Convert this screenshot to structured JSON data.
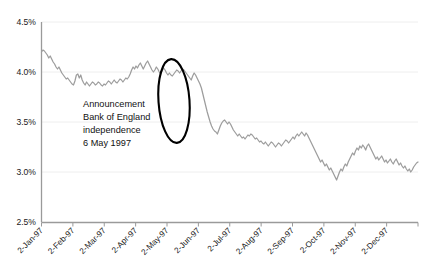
{
  "chart_data": {
    "type": "line",
    "title": "",
    "subtitle": "",
    "xlabel": "",
    "ylabel": "",
    "ylim": [
      2.5,
      4.5
    ],
    "ytick_values": [
      4.5,
      4.0,
      3.5,
      3.0,
      2.5
    ],
    "ytick_labels": [
      "4.5%",
      "4.0%",
      "3.5%",
      "3.0%",
      "2.5%"
    ],
    "grid": "horizontal",
    "legend": "none",
    "xtick_labels": [
      "2-Jan-97",
      "2-Feb-97",
      "2-Mar-97",
      "2-Apr-97",
      "2-May-97",
      "2-Jun-97",
      "2-Jul-97",
      "2-Aug-97",
      "2-Sep-97",
      "2-Oct-97",
      "2-Nov-97",
      "2-Dec-97"
    ],
    "series": [
      {
        "name": "rate",
        "color": "#9d9d9d",
        "x": [
          0,
          1,
          2,
          3,
          4,
          5,
          6,
          7,
          8,
          9,
          10,
          11,
          12,
          13,
          14,
          15,
          16,
          17,
          18,
          19,
          20,
          21,
          22,
          23,
          24,
          25,
          26,
          27,
          28,
          29,
          30,
          31,
          32,
          33,
          34,
          35,
          36,
          37,
          38,
          39,
          40,
          41,
          42,
          43,
          44,
          45,
          46,
          47,
          48,
          49,
          50,
          51,
          52,
          53,
          54,
          55,
          56,
          57,
          58,
          59,
          60,
          61,
          62,
          63,
          64,
          65,
          66,
          67,
          68,
          69,
          70,
          71,
          72,
          73,
          74,
          75,
          76,
          77,
          78,
          79,
          80,
          81,
          82,
          83,
          84,
          85,
          86,
          87,
          88,
          89,
          90,
          91,
          92,
          93,
          94,
          95,
          96,
          97,
          98,
          99,
          100,
          101,
          102,
          103,
          104,
          105,
          106,
          107,
          108,
          109,
          110,
          111,
          112,
          113,
          114,
          115,
          116,
          117,
          118,
          119,
          120,
          121,
          122,
          123,
          124,
          125,
          126,
          127,
          128,
          129,
          130,
          131,
          132,
          133,
          134,
          135,
          136,
          137,
          138,
          139,
          140,
          141,
          142,
          143,
          144,
          145,
          146,
          147,
          148,
          149,
          150,
          151,
          152,
          153,
          154,
          155,
          156,
          157,
          158,
          159,
          160,
          161,
          162,
          163,
          164,
          165,
          166,
          167,
          168,
          169,
          170,
          171,
          172,
          173,
          174,
          175,
          176,
          177,
          178,
          179,
          180,
          181,
          182,
          183,
          184,
          185,
          186,
          187,
          188,
          189,
          190,
          191,
          192,
          193,
          194,
          195,
          196,
          197,
          198,
          199,
          200,
          201,
          202,
          203,
          204,
          205,
          206,
          207,
          208,
          209,
          210,
          211,
          212,
          213,
          214,
          215,
          216,
          217,
          218,
          219,
          220,
          221,
          222,
          223,
          224,
          225,
          226,
          227,
          228,
          229,
          230,
          231,
          232,
          233,
          234,
          235,
          236,
          237,
          238,
          239,
          240,
          241,
          242,
          243,
          244,
          245,
          246,
          247,
          248,
          249,
          250,
          251,
          252,
          253,
          254,
          255,
          256,
          257,
          258,
          259
        ],
        "values": [
          4.2,
          4.22,
          4.21,
          4.19,
          4.17,
          4.14,
          4.16,
          4.13,
          4.1,
          4.08,
          4.05,
          4.03,
          4.05,
          4.02,
          3.99,
          3.97,
          3.95,
          3.93,
          3.94,
          3.92,
          3.9,
          3.88,
          3.87,
          3.91,
          3.97,
          3.98,
          3.94,
          3.97,
          3.92,
          3.89,
          3.87,
          3.9,
          3.88,
          3.86,
          3.88,
          3.9,
          3.89,
          3.87,
          3.88,
          3.9,
          3.89,
          3.87,
          3.86,
          3.88,
          3.87,
          3.89,
          3.91,
          3.9,
          3.88,
          3.9,
          3.92,
          3.9,
          3.89,
          3.91,
          3.93,
          3.92,
          3.9,
          3.92,
          3.94,
          3.93,
          3.95,
          3.98,
          4.02,
          4.05,
          4.03,
          4.06,
          4.04,
          4.07,
          4.09,
          4.06,
          4.03,
          4.06,
          4.09,
          4.11,
          4.08,
          4.05,
          4.02,
          4.0,
          4.02,
          4.05,
          4.03,
          4.0,
          3.98,
          4.01,
          4.04,
          4.02,
          3.99,
          3.97,
          3.99,
          3.97,
          3.96,
          3.98,
          4.0,
          4.02,
          4.01,
          3.99,
          4.01,
          4.03,
          4.02,
          4.0,
          3.98,
          3.96,
          3.94,
          3.92,
          3.96,
          3.99,
          3.97,
          3.94,
          3.91,
          3.88,
          3.84,
          3.78,
          3.72,
          3.66,
          3.6,
          3.55,
          3.5,
          3.46,
          3.43,
          3.41,
          3.4,
          3.38,
          3.42,
          3.46,
          3.49,
          3.51,
          3.52,
          3.5,
          3.48,
          3.5,
          3.48,
          3.45,
          3.42,
          3.4,
          3.38,
          3.36,
          3.38,
          3.36,
          3.34,
          3.35,
          3.33,
          3.35,
          3.37,
          3.36,
          3.38,
          3.37,
          3.35,
          3.33,
          3.34,
          3.32,
          3.3,
          3.31,
          3.29,
          3.28,
          3.3,
          3.28,
          3.26,
          3.28,
          3.3,
          3.29,
          3.27,
          3.25,
          3.27,
          3.29,
          3.28,
          3.26,
          3.28,
          3.3,
          3.32,
          3.31,
          3.29,
          3.31,
          3.33,
          3.35,
          3.33,
          3.36,
          3.38,
          3.36,
          3.38,
          3.4,
          3.38,
          3.36,
          3.39,
          3.37,
          3.34,
          3.31,
          3.28,
          3.25,
          3.22,
          3.19,
          3.16,
          3.13,
          3.1,
          3.12,
          3.09,
          3.06,
          3.08,
          3.05,
          3.02,
          3.04,
          3.01,
          2.98,
          2.95,
          2.92,
          2.96,
          3.0,
          3.03,
          3.01,
          3.05,
          3.08,
          3.06,
          3.1,
          3.13,
          3.16,
          3.19,
          3.17,
          3.21,
          3.24,
          3.22,
          3.26,
          3.24,
          3.27,
          3.25,
          3.22,
          3.26,
          3.28,
          3.25,
          3.22,
          3.19,
          3.16,
          3.13,
          3.15,
          3.12,
          3.14,
          3.16,
          3.13,
          3.1,
          3.12,
          3.09,
          3.11,
          3.13,
          3.1,
          3.08,
          3.11,
          3.13,
          3.1,
          3.07,
          3.09,
          3.06,
          3.04,
          3.06,
          3.03,
          3.01,
          3.03,
          3.0,
          3.02,
          3.05,
          3.07,
          3.09,
          3.1
        ]
      }
    ],
    "annotations": [
      {
        "name": "announcement-callout",
        "lines": [
          "Announcement",
          "Bank of England",
          "independence",
          "6 May 1997"
        ]
      }
    ],
    "highlight": {
      "shape": "ellipse",
      "description": "black ellipse circling the sharp drop around early May 1997",
      "color": "#000000"
    },
    "colors": {
      "series": "#9d9d9d",
      "grid": "#ececec",
      "axis": "#9a9a9a",
      "text": "#1a1a1a",
      "highlight": "#000000",
      "background": "#ffffff"
    }
  }
}
